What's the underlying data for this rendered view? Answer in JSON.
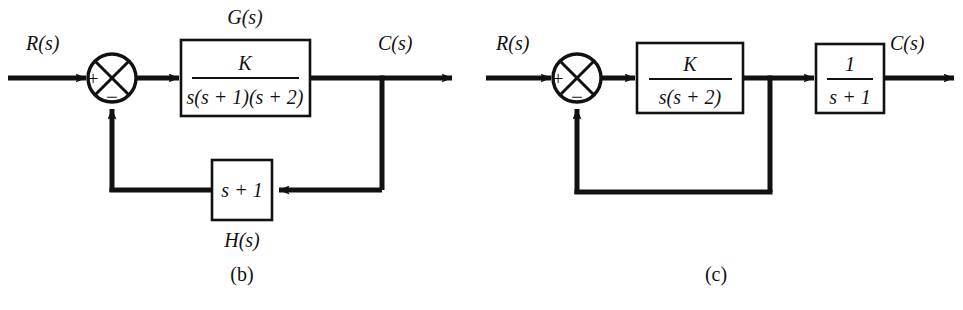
{
  "figure": {
    "type": "control-system-block-diagram",
    "background_color": "#ffffff",
    "line_color": "#111111",
    "panels": [
      {
        "id": "b",
        "caption": "(b)",
        "input_label": "R(s)",
        "output_label": "C(s)",
        "summing_junction": {
          "style": "circle-with-cross",
          "input_sign": "+",
          "feedback_sign": "−"
        },
        "forward_block": {
          "top_label": "G(s)",
          "numerator": "K",
          "denominator": "s(s + 1)(s + 2)"
        },
        "feedback_block": {
          "bottom_label": "H(s)",
          "expression": "s + 1"
        }
      },
      {
        "id": "c",
        "caption": "(c)",
        "input_label": "R(s)",
        "output_label": "C(s)",
        "summing_junction": {
          "style": "circle-with-cross",
          "input_sign": "+",
          "feedback_sign": "−"
        },
        "forward_block_1": {
          "numerator": "K",
          "denominator": "s(s + 2)"
        },
        "forward_block_2": {
          "numerator": "1",
          "denominator": "s + 1"
        },
        "feedback_block": {
          "expression": "unity"
        }
      }
    ]
  },
  "panel_b": {
    "caption": "(b)",
    "input_label": "R(s)",
    "output_label": "C(s)",
    "g_label": "G(s)",
    "g_numerator": "K",
    "g_denominator": "s(s + 1)(s + 2)",
    "h_label": "H(s)",
    "h_expression": "s + 1",
    "plus_sign": "+",
    "minus_sign": "−"
  },
  "panel_c": {
    "caption": "(c)",
    "input_label": "R(s)",
    "output_label": "C(s)",
    "block1_numerator": "K",
    "block1_denominator": "s(s + 2)",
    "block2_numerator": "1",
    "block2_denominator": "s + 1",
    "plus_sign": "+",
    "minus_sign": "−"
  }
}
